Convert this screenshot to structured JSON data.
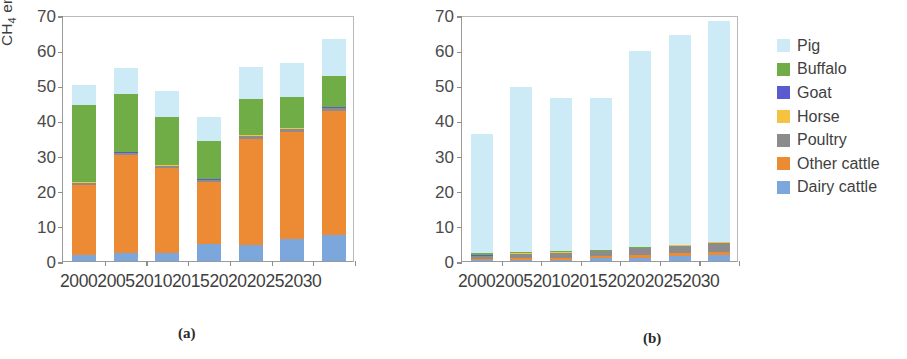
{
  "figure": {
    "caption_a": "(a)",
    "caption_b": "(b)"
  },
  "colors": {
    "pig": "#ccebf7",
    "buffalo": "#70ad47",
    "goat": "#5b5bd0",
    "horse": "#f5c242",
    "poultry": "#8c8c8c",
    "other_cattle": "#ed8b34",
    "dairy_cattle": "#7ba7dd",
    "axis": "#9a9a9a",
    "text": "#3f3f3f"
  },
  "legend": {
    "position": "right",
    "items": [
      {
        "label": "Pig",
        "color": "#ccebf7"
      },
      {
        "label": "Buffalo",
        "color": "#70ad47"
      },
      {
        "label": "Goat",
        "color": "#5b5bd0"
      },
      {
        "label": "Horse",
        "color": "#f5c242"
      },
      {
        "label": "Poultry",
        "color": "#8c8c8c"
      },
      {
        "label": "Other cattle",
        "color": "#ed8b34"
      },
      {
        "label": "Dairy cattle",
        "color": "#7ba7dd"
      }
    ]
  },
  "chart_data": [
    {
      "id": "a",
      "type": "bar",
      "stacked": true,
      "title": "",
      "xlabel": "",
      "ylabel": "CH4 emissions (kt)",
      "ylabel_html": "CH<sub>4</sub> emissions (kt)",
      "ylim": [
        0,
        70
      ],
      "yticks": [
        0,
        10,
        20,
        30,
        40,
        50,
        60,
        70
      ],
      "ytick_labels": [
        "0",
        "10",
        "20",
        "30",
        "40",
        "50",
        "60",
        "70"
      ],
      "grid": false,
      "categories": [
        "2000",
        "2005",
        "2010",
        "2015",
        "2020",
        "2025",
        "2030"
      ],
      "series": [
        {
          "name": "Dairy cattle",
          "color": "#7ba7dd",
          "values": [
            1.6,
            2.2,
            2.3,
            4.8,
            4.5,
            6.2,
            7.3
          ]
        },
        {
          "name": "Other cattle",
          "color": "#ed8b34",
          "values": [
            20.1,
            28.1,
            24.1,
            17.8,
            30.3,
            30.6,
            35.4
          ]
        },
        {
          "name": "Poultry",
          "color": "#8c8c8c",
          "values": [
            0.5,
            0.5,
            0.6,
            0.6,
            0.8,
            0.8,
            0.9
          ]
        },
        {
          "name": "Goat",
          "color": "#5b5bd0",
          "values": [
            0.1,
            0.1,
            0.1,
            0.1,
            0.1,
            0.1,
            0.1
          ]
        },
        {
          "name": "Horse",
          "color": "#f5c242",
          "values": [
            0.1,
            0.1,
            0.1,
            0.1,
            0.1,
            0.1,
            0.1
          ]
        },
        {
          "name": "Buffalo",
          "color": "#70ad47",
          "values": [
            22.1,
            16.5,
            13.9,
            10.8,
            10.4,
            8.8,
            8.8
          ]
        },
        {
          "name": "Pig",
          "color": "#ccebf7",
          "values": [
            5.5,
            7.5,
            7.4,
            6.8,
            9.1,
            9.8,
            10.5
          ]
        }
      ],
      "totals": [
        50.0,
        55.0,
        48.5,
        41.0,
        55.3,
        56.4,
        63.1
      ]
    },
    {
      "id": "b",
      "type": "bar",
      "stacked": true,
      "title": "",
      "xlabel": "",
      "ylabel": "",
      "ylim": [
        0,
        70
      ],
      "yticks": [
        0,
        10,
        20,
        30,
        40,
        50,
        60,
        70
      ],
      "ytick_labels": [
        "0",
        "10",
        "20",
        "30",
        "40",
        "50",
        "60",
        "70"
      ],
      "grid": false,
      "categories": [
        "2000",
        "2005",
        "2010",
        "2015",
        "2020",
        "2025",
        "2030"
      ],
      "series": [
        {
          "name": "Dairy cattle",
          "color": "#7ba7dd",
          "values": [
            0.2,
            0.3,
            0.4,
            0.9,
            1.0,
            1.3,
            1.6
          ]
        },
        {
          "name": "Other cattle",
          "color": "#ed8b34",
          "values": [
            0.5,
            0.6,
            0.6,
            0.5,
            0.8,
            0.9,
            1.0
          ]
        },
        {
          "name": "Poultry",
          "color": "#8c8c8c",
          "values": [
            0.8,
            1.1,
            1.3,
            1.4,
            1.8,
            2.1,
            2.5
          ]
        },
        {
          "name": "Goat",
          "color": "#5b5bd0",
          "values": [
            0.1,
            0.1,
            0.1,
            0.1,
            0.1,
            0.1,
            0.1
          ]
        },
        {
          "name": "Horse",
          "color": "#f5c242",
          "values": [
            0.1,
            0.1,
            0.1,
            0.1,
            0.1,
            0.1,
            0.1
          ]
        },
        {
          "name": "Buffalo",
          "color": "#70ad47",
          "values": [
            0.5,
            0.4,
            0.3,
            0.2,
            0.2,
            0.2,
            0.2
          ]
        },
        {
          "name": "Pig",
          "color": "#ccebf7",
          "values": [
            33.9,
            46.8,
            43.6,
            43.1,
            55.8,
            59.7,
            62.7
          ]
        }
      ],
      "totals": [
        36.1,
        49.4,
        46.4,
        46.3,
        59.8,
        64.4,
        68.2
      ]
    }
  ]
}
